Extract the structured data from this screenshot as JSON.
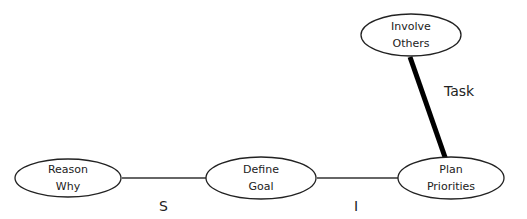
{
  "diagram": {
    "nodes": [
      {
        "id": "reason-why",
        "line1": "Reason",
        "line2": "Why"
      },
      {
        "id": "define-goal",
        "line1": "Define",
        "line2": "Goal"
      },
      {
        "id": "plan-priorities",
        "line1": "Plan",
        "line2": "Priorities"
      },
      {
        "id": "involve-others",
        "line1": "Involve",
        "line2": "Others"
      }
    ],
    "edges": [
      {
        "from": "reason-why",
        "to": "define-goal",
        "label": "S",
        "weight": "thin"
      },
      {
        "from": "define-goal",
        "to": "plan-priorities",
        "label": "I",
        "weight": "thin"
      },
      {
        "from": "involve-others",
        "to": "plan-priorities",
        "label": "Task",
        "weight": "thick"
      }
    ],
    "colors": {
      "stroke": "#111111",
      "background": "#ffffff"
    }
  }
}
